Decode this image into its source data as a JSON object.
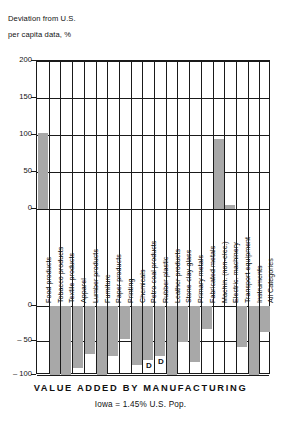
{
  "axis_title": {
    "line1": "Deviation from U.S.",
    "line2": "per capita data, %"
  },
  "caption": {
    "main": "VALUE ADDED BY MANUFACTURING",
    "sub": "Iowa = 1.45% U.S. Pop."
  },
  "chart_data": {
    "type": "bar",
    "title": "VALUE ADDED BY MANUFACTURING",
    "subtitle": "Iowa = 1.45% U.S. Pop.",
    "xlabel": "",
    "ylabel": "Deviation from U.S. per capita data, %",
    "ylim": [
      -100,
      200
    ],
    "broken_axis": true,
    "upper_panel_range": [
      0,
      200
    ],
    "lower_panel_range": [
      -100,
      0
    ],
    "grid": true,
    "legend": null,
    "upper_ticks": [
      200,
      150,
      100,
      50,
      0
    ],
    "lower_ticks": [
      0,
      -50,
      -100
    ],
    "bar_color": "#a8a8a8",
    "axis_color": "#1a1a1a",
    "categories": [
      "Food products",
      "Tobacco products",
      "Textile products",
      "Apparel",
      "Lumber products",
      "Furniture",
      "Paper products",
      "Printing",
      "Chemicals",
      "Petro-coal products",
      "Rubber-plastic",
      "Leather products",
      "Stone-clay-glass",
      "Primary metals",
      "Fabricated metals",
      "Machin. (non-elec.)",
      "Electric. machinery",
      "Transport equipment",
      "Instruments",
      "All Categories"
    ],
    "values": [
      103,
      -100,
      -100,
      -90,
      -70,
      -100,
      -73,
      -48,
      -86,
      null,
      null,
      -100,
      -52,
      -81,
      -33,
      94,
      5,
      -60,
      -100,
      -38
    ],
    "annotations": [
      {
        "category": "Petro-coal products",
        "label": "D",
        "value": -78
      },
      {
        "category": "Rubber-plastic",
        "label": "D",
        "value": -72
      }
    ]
  }
}
